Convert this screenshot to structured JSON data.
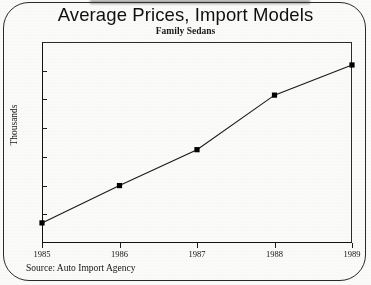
{
  "chart_data": {
    "type": "line",
    "title": "Average Prices, Import Models",
    "subtitle": "Family Sedans",
    "xlabel": "",
    "ylabel": "Thousands",
    "categories": [
      "1985",
      "1986",
      "1987",
      "1988",
      "1989"
    ],
    "x": [
      1985,
      1986,
      1987,
      1988,
      1989
    ],
    "values": [
      8.7,
      10.0,
      11.25,
      13.15,
      14.2
    ],
    "series": [
      {
        "name": "Family Sedans",
        "values": [
          8.7,
          10.0,
          11.25,
          13.15,
          14.2
        ]
      }
    ],
    "ylim": [
      8,
      15
    ],
    "yticks": [
      8,
      9,
      10,
      11,
      12,
      13,
      14,
      15
    ],
    "ytick_labels": [
      "8",
      "9",
      "10",
      "11",
      "12",
      "13",
      "14",
      "15"
    ],
    "xtick_labels": [
      "1985",
      "1986",
      "1987",
      "1988",
      "1989"
    ],
    "grid": false,
    "legend": false,
    "marker": "square",
    "line_color": "#1a1a1a",
    "marker_color": "#000000",
    "axis_color": "#111111",
    "background_color": "#fdfdfc",
    "annotations": [
      "Source: Auto Import Agency"
    ]
  },
  "figure": {
    "source_note": "Source: Auto Import Agency"
  }
}
